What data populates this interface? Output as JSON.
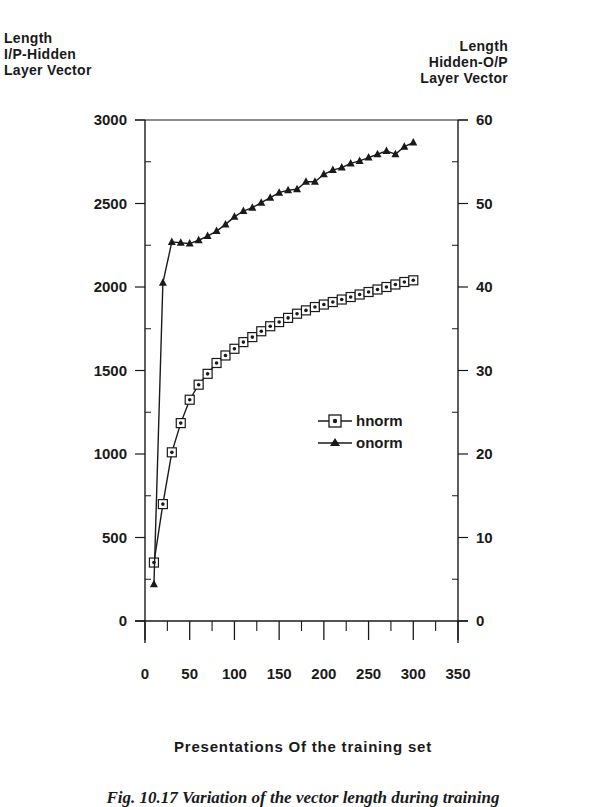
{
  "figure": {
    "left_axis_title": [
      "Length",
      "I/P-Hidden",
      "Layer Vector"
    ],
    "right_axis_title": [
      "Length",
      "Hidden-O/P",
      "Layer Vector"
    ],
    "x_axis_title": "Presentations Of the training set",
    "caption": "Fig. 10.17 Variation of the vector length during training"
  },
  "legend": {
    "items": [
      {
        "label": "hnorm",
        "marker": "square-dot"
      },
      {
        "label": "onorm",
        "marker": "triangle"
      }
    ]
  },
  "chart_data": {
    "type": "line",
    "title": "",
    "xlabel": "Presentations Of the training set",
    "ylabel": "Length I/P-Hidden Layer Vector",
    "y2label": "Length Hidden-O/P Layer Vector",
    "xlim": [
      0,
      350
    ],
    "ylim": [
      0,
      3000
    ],
    "y2lim": [
      0,
      60
    ],
    "x_ticks": [
      0,
      50,
      100,
      150,
      200,
      250,
      300,
      350
    ],
    "y_ticks": [
      0,
      500,
      1000,
      1500,
      2000,
      2500,
      3000
    ],
    "y2_ticks": [
      0,
      10,
      20,
      30,
      40,
      50,
      60
    ],
    "grid": false,
    "legend_position": "inside-right-middle",
    "x": [
      10,
      20,
      30,
      40,
      50,
      60,
      70,
      80,
      90,
      100,
      110,
      120,
      130,
      140,
      150,
      160,
      170,
      180,
      190,
      200,
      210,
      220,
      230,
      240,
      250,
      260,
      270,
      280,
      290,
      300
    ],
    "series": [
      {
        "name": "hnorm",
        "axis": "left",
        "marker": "square-dot",
        "values": [
          350,
          700,
          1010,
          1185,
          1325,
          1415,
          1480,
          1545,
          1590,
          1630,
          1670,
          1700,
          1735,
          1765,
          1790,
          1815,
          1840,
          1860,
          1880,
          1895,
          1910,
          1925,
          1940,
          1955,
          1970,
          1985,
          2000,
          2015,
          2030,
          2040
        ]
      },
      {
        "name": "onorm",
        "axis": "right",
        "marker": "triangle",
        "values": [
          4.4,
          40.5,
          45.4,
          45.3,
          45.2,
          45.6,
          46.1,
          46.7,
          47.5,
          48.4,
          49.1,
          49.5,
          50.1,
          50.7,
          51.3,
          51.6,
          51.7,
          52.6,
          52.6,
          53.5,
          54.0,
          54.3,
          54.8,
          55.1,
          55.5,
          55.9,
          56.3,
          55.9,
          56.8,
          57.3
        ]
      }
    ]
  }
}
